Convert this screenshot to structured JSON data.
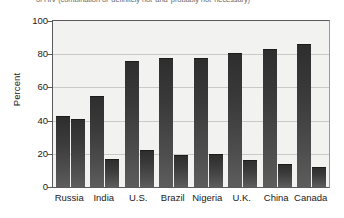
{
  "caption": {
    "text": "of HIV (combination of 'definitely not' and 'probably not' necessary)"
  },
  "chart_data": {
    "type": "bar",
    "title": "",
    "xlabel": "",
    "ylabel": "Percent",
    "ylim": [
      0,
      100
    ],
    "yticks": [
      0,
      20,
      40,
      60,
      80,
      100
    ],
    "grid": true,
    "legend_position": "none",
    "categories": [
      "Russia",
      "India",
      "U.S.",
      "Brazil",
      "Nigeria",
      "U.K.",
      "China",
      "Canada"
    ],
    "series": [
      {
        "name": "Series 1",
        "values": [
          43,
          55,
          76,
          78,
          78,
          81,
          83,
          86
        ]
      },
      {
        "name": "Series 2",
        "values": [
          41,
          17,
          22,
          19,
          20,
          16,
          14,
          12
        ]
      }
    ]
  }
}
